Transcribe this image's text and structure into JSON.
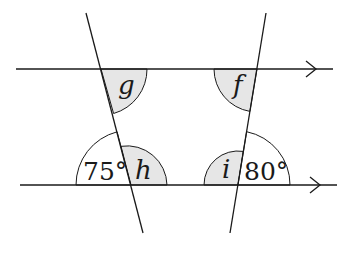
{
  "diagram": {
    "lines": {
      "top_parallel": {
        "y": 69
      },
      "bottom_parallel": {
        "y": 185
      }
    },
    "angles": {
      "g": {
        "label": "g",
        "shaded": true
      },
      "f": {
        "label": "f",
        "shaded": true
      },
      "h": {
        "label": "h",
        "shaded": true
      },
      "i": {
        "label": "i",
        "shaded": true
      },
      "given_left": {
        "label": "75°",
        "value": 75,
        "shaded": false
      },
      "given_right": {
        "label": "80°",
        "value": 80,
        "shaded": false
      }
    },
    "colors": {
      "line": "#1a1a1a",
      "shade": "#e6e6e6"
    }
  }
}
